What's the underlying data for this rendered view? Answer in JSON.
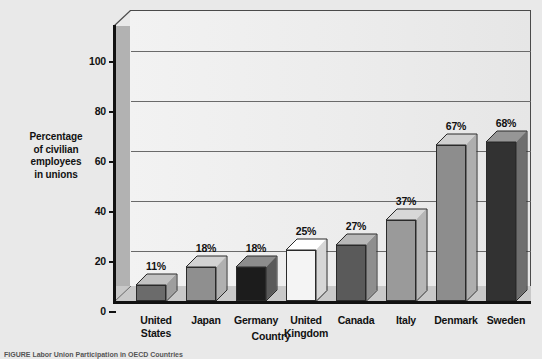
{
  "chart_data": {
    "type": "bar",
    "title": "",
    "xlabel": "Country",
    "ylabel": "Percentage of civilian employees in unions",
    "ylabel_lines": [
      "Percentage",
      "of civilian",
      "employees",
      "in unions"
    ],
    "categories": [
      "United States",
      "Japan",
      "Germany",
      "United Kingdom",
      "Canada",
      "Italy",
      "Denmark",
      "Sweden"
    ],
    "category_lines": [
      [
        "United",
        "States"
      ],
      [
        "Japan"
      ],
      [
        "Germany"
      ],
      [
        "United",
        "Kingdom"
      ],
      [
        "Canada"
      ],
      [
        "Italy"
      ],
      [
        "Denmark"
      ],
      [
        "Sweden"
      ]
    ],
    "values": [
      11,
      18,
      18,
      25,
      27,
      37,
      67,
      68
    ],
    "value_labels": [
      "11%",
      "18%",
      "18%",
      "25%",
      "27%",
      "37%",
      "67%",
      "68%"
    ],
    "ylim": [
      0,
      110
    ],
    "yticks": [
      0,
      20,
      40,
      60,
      80,
      100
    ],
    "ytick_labels": [
      "0",
      "20",
      "40",
      "60",
      "80",
      "100"
    ],
    "grid": true,
    "legend": "none",
    "style": "3d-column",
    "bar_colors": [
      "#6b6b6b",
      "#8f8f8f",
      "#1c1c1c",
      "#f4f4f4",
      "#5a5a5a",
      "#9a9a9a",
      "#8d8d8d",
      "#323232"
    ],
    "bar_top_colors": [
      "#c2c2c2",
      "#d2d2d2",
      "#8d8d8d",
      "#ffffff",
      "#b8b8b8",
      "#d8d8d8",
      "#d0d0d0",
      "#969696"
    ],
    "bar_side_colors": [
      "#9e9e9e",
      "#b0b0b0",
      "#5a5a5a",
      "#d6d6d6",
      "#8e8e8e",
      "#b6b6b6",
      "#aeaeae",
      "#6e6e6e"
    ]
  },
  "figure": {
    "caption": "FIGURE  Labor Union Participation in OECD Countries"
  },
  "colors": {
    "background": "#e9e9e9",
    "plot_back_wall": "#efefef",
    "plot_side_wall": "#b2b2b2",
    "plot_floor": "#c9c9c9",
    "axis": "#111111",
    "gridline": "#6a6a6a",
    "text": "#111111"
  }
}
